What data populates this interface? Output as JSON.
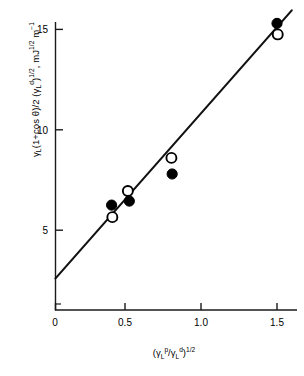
{
  "chart_data": {
    "type": "scatter",
    "title": "",
    "xlabel": "(γL^p/γL^d)^1/2",
    "ylabel": "γL(1+cos θ)/2 (γL^d)^1/2, mJ^1/2 m^-1",
    "xlim": [
      0,
      1.66
    ],
    "ylim": [
      0,
      16.6
    ],
    "xticks": [
      0,
      0.5,
      1.0,
      1.5
    ],
    "xtick_labels": [
      "0",
      "0.5",
      "1.0",
      "1.5"
    ],
    "yticks": [
      5,
      10,
      15
    ],
    "ytick_labels": [
      "5",
      "10",
      "15"
    ],
    "grid": false,
    "legend": "none",
    "series": [
      {
        "name": "filled-circles",
        "marker": "filled-circle",
        "color": "#000000",
        "points": [
          {
            "x": 0.38,
            "y": 6.25
          },
          {
            "x": 0.5,
            "y": 6.45
          },
          {
            "x": 0.79,
            "y": 7.8
          },
          {
            "x": 1.5,
            "y": 15.3
          }
        ]
      },
      {
        "name": "open-circles",
        "marker": "open-circle",
        "color": "#000000",
        "points": [
          {
            "x": 0.385,
            "y": 5.65
          },
          {
            "x": 0.49,
            "y": 6.95
          },
          {
            "x": 0.785,
            "y": 8.6
          },
          {
            "x": 1.505,
            "y": 14.75
          }
        ]
      }
    ],
    "fit_line": {
      "name": "regression-line",
      "x0": 0.0,
      "y0": 2.6,
      "x1": 1.6,
      "y1": 15.95,
      "intercept": 2.6,
      "slope": 8.34
    }
  },
  "axis_labels": {
    "y_parts": {
      "g1": "γ",
      "sub1": "L",
      "mid": "(1+cos θ)/2 (",
      "g2": "γ",
      "sub2": "L",
      "sup2": "d",
      "close": ")",
      "sup3": "1/2",
      "comma": ", mJ",
      "sup4": "1/2",
      "unit": " m",
      "sup5": "−1"
    },
    "x_parts": {
      "open": "(",
      "g1": "γ",
      "sub1": "L",
      "sup1": "p",
      "slash": "/",
      "g2": "γ",
      "sub2": "L",
      "sup2": "d",
      "close": ")",
      "sup3": "1/2"
    }
  }
}
